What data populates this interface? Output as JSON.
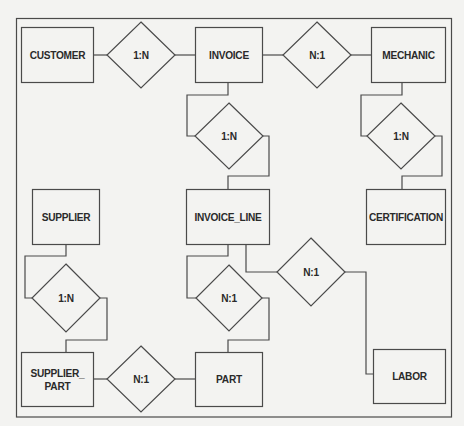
{
  "diagram": {
    "type": "entity-relationship",
    "entities": [
      {
        "id": "customer",
        "label": "CUSTOMER"
      },
      {
        "id": "invoice",
        "label": "INVOICE"
      },
      {
        "id": "mechanic",
        "label": "MECHANIC"
      },
      {
        "id": "supplier",
        "label": "SUPPLIER"
      },
      {
        "id": "invoice_line",
        "label": "INVOICE_LINE"
      },
      {
        "id": "certification",
        "label": "CERTIFICATION"
      },
      {
        "id": "supplier_part",
        "label": "SUPPLIER_\nPART"
      },
      {
        "id": "part",
        "label": "PART"
      },
      {
        "id": "labor",
        "label": "LABOR"
      }
    ],
    "relationships": [
      {
        "id": "r1",
        "label": "1:N",
        "from": "CUSTOMER",
        "to": "INVOICE"
      },
      {
        "id": "r2",
        "label": "N:1",
        "from": "INVOICE",
        "to": "MECHANIC"
      },
      {
        "id": "r3",
        "label": "1:N",
        "from": "INVOICE",
        "to": "INVOICE_LINE"
      },
      {
        "id": "r4",
        "label": "1:N",
        "from": "MECHANIC",
        "to": "CERTIFICATION"
      },
      {
        "id": "r5",
        "label": "1:N",
        "from": "SUPPLIER",
        "to": "SUPPLIER_PART"
      },
      {
        "id": "r6",
        "label": "N:1",
        "from": "INVOICE_LINE",
        "to": "PART"
      },
      {
        "id": "r7",
        "label": "N:1",
        "from": "INVOICE_LINE",
        "to": "LABOR"
      },
      {
        "id": "r8",
        "label": "N:1",
        "from": "SUPPLIER_PART",
        "to": "PART"
      }
    ]
  }
}
